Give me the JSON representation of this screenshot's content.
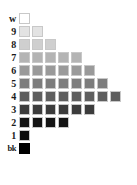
{
  "chart_data": {
    "type": "bar",
    "title": "",
    "subtitle": "",
    "xlabel": "",
    "ylabel": "",
    "grid": false,
    "legend": null,
    "orientation": "horizontal",
    "categories": [
      "w",
      "9",
      "8",
      "7",
      "6",
      "5",
      "4",
      "3",
      "2",
      "1",
      "bk"
    ],
    "values": [
      1,
      2,
      3,
      5,
      6,
      7,
      8,
      6,
      4,
      1,
      1
    ],
    "swatch_colors": [
      "#ffffff",
      "#e3e3e3",
      "#cfcfcf",
      "#b4b4b4",
      "#9a9a9a",
      "#7d7d7d",
      "#5e5e5e",
      "#3c3c3c",
      "#141414",
      "#0a0a0a",
      "#000000"
    ],
    "xlim": [
      0,
      8
    ],
    "ylim": null
  },
  "rows": [
    {
      "label": "w",
      "count": 1,
      "color": "#ffffff",
      "outlined": true
    },
    {
      "label": "9",
      "count": 2,
      "color": "#e3e3e3",
      "outlined": true
    },
    {
      "label": "8",
      "count": 3,
      "color": "#cfcfcf",
      "outlined": true
    },
    {
      "label": "7",
      "count": 5,
      "color": "#b4b4b4",
      "outlined": true
    },
    {
      "label": "6",
      "count": 6,
      "color": "#9a9a9a",
      "outlined": true
    },
    {
      "label": "5",
      "count": 7,
      "color": "#7d7d7d",
      "outlined": true
    },
    {
      "label": "4",
      "count": 8,
      "color": "#5e5e5e",
      "outlined": true
    },
    {
      "label": "3",
      "count": 6,
      "color": "#3c3c3c",
      "outlined": true
    },
    {
      "label": "2",
      "count": 4,
      "color": "#141414",
      "outlined": true
    },
    {
      "label": "1",
      "count": 1,
      "color": "#0a0a0a",
      "outlined": true
    },
    {
      "label": "bk",
      "count": 1,
      "color": "#000000",
      "outlined": false
    }
  ]
}
